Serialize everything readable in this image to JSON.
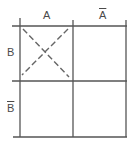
{
  "diagram": {
    "type": "venn-table-grid",
    "columns": [
      {
        "label": "A"
      },
      {
        "label": "Ā"
      }
    ],
    "rows": [
      {
        "label": "B"
      },
      {
        "label": "B̄"
      }
    ],
    "cells": [
      [
        {
          "mark": "dashed-x"
        },
        {
          "mark": "empty"
        }
      ],
      [
        {
          "mark": "empty"
        },
        {
          "mark": "empty"
        }
      ]
    ],
    "colors": {
      "line": "#555555",
      "background": "#ffffff"
    }
  },
  "labels": {
    "col_a": "A",
    "col_not_a": "A",
    "row_b": "B",
    "row_not_b": "B"
  }
}
